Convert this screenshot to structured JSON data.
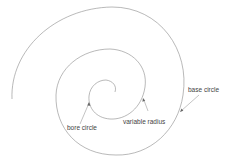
{
  "diagram": {
    "type": "spiral cam profile",
    "labels": {
      "bore_circle": "bore circle",
      "variable_radius": "variable radius",
      "base_circle": "base circle"
    },
    "colors": {
      "line": "#8a8a8a",
      "text": "#444444",
      "background": "#ffffff"
    }
  }
}
